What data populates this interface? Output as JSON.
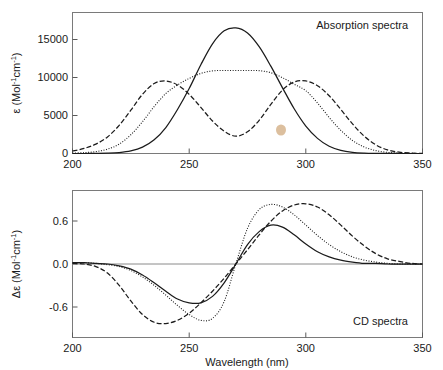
{
  "figure": {
    "width": 443,
    "height": 370,
    "background": "#ffffff",
    "line_color": "#1b1b1b"
  },
  "panels": {
    "top": {
      "annotation": "Absorption spectra",
      "ylabel_main": "ε (Mol",
      "ylabel_sup1": "-1",
      "ylabel_mid": "cm",
      "ylabel_sup2": "-1",
      "ylabel_end": ")",
      "ylabel_full": "ε (Mol⁻¹cm⁻¹)",
      "yticks": [
        "0",
        "5000",
        "10000",
        "15000"
      ],
      "xticks": [
        "200",
        "250",
        "300",
        "350"
      ]
    },
    "bottom": {
      "annotation": "CD spectra",
      "ylabel_full": "Δε (Mol⁻¹cm⁻¹)",
      "yticks": [
        "-0.6",
        "0.0",
        "0.6"
      ],
      "xticks": [
        "200",
        "250",
        "300",
        "350"
      ],
      "xlabel": "Wavelength (nm)"
    }
  },
  "chart_data": [
    {
      "type": "line",
      "id": "absorption-spectra",
      "title": "Absorption spectra",
      "xlabel": "Wavelength (nm)",
      "ylabel": "ε (Mol⁻¹cm⁻¹)",
      "xlim": [
        200,
        350
      ],
      "ylim": [
        0,
        18500
      ],
      "xticks": [
        200,
        250,
        300,
        350
      ],
      "yticks": [
        0,
        5000,
        10000,
        15000
      ],
      "grid": false,
      "legend": "none",
      "series": [
        {
          "name": "solid-monomer",
          "style": "solid",
          "color": "#1b1b1b",
          "description": "single gaussian band centred near 270 nm",
          "peaks": [
            {
              "x": 270,
              "y": 17400
            }
          ],
          "x": [
            200,
            205,
            210,
            215,
            220,
            225,
            230,
            235,
            240,
            245,
            250,
            255,
            260,
            265,
            270,
            275,
            280,
            285,
            290,
            295,
            300,
            305,
            310,
            315,
            320,
            325,
            330,
            335,
            340,
            345,
            350
          ],
          "y": [
            0,
            0,
            10,
            40,
            130,
            360,
            880,
            1900,
            3600,
            6100,
            9000,
            12300,
            15200,
            17000,
            17400,
            16700,
            14800,
            12100,
            9100,
            6200,
            3800,
            2100,
            1000,
            430,
            160,
            50,
            15,
            5,
            0,
            0,
            0
          ]
        },
        {
          "name": "dotted-intermediate",
          "style": "dotted",
          "color": "#1b1b1b",
          "description": "broad flat-topped band, plateau at ~11500 between 258 and 285 nm",
          "peaks": [
            {
              "x": 240,
              "y": 9000
            },
            {
              "x": 272,
              "y": 11500
            },
            {
              "x": 300,
              "y": 8700
            }
          ],
          "x": [
            200,
            205,
            210,
            215,
            220,
            225,
            230,
            235,
            240,
            245,
            250,
            255,
            260,
            265,
            270,
            275,
            280,
            285,
            290,
            295,
            300,
            305,
            310,
            315,
            320,
            325,
            330,
            335,
            340,
            345,
            350
          ],
          "y": [
            60,
            120,
            260,
            600,
            1300,
            2600,
            4400,
            6500,
            8300,
            9500,
            10400,
            11100,
            11450,
            11500,
            11500,
            11500,
            11480,
            11200,
            10500,
            9600,
            8700,
            7000,
            5000,
            3200,
            1800,
            900,
            400,
            160,
            60,
            20,
            0
          ]
        },
        {
          "name": "dashed-exciton-split",
          "style": "dashed",
          "color": "#1b1b1b",
          "description": "exciton-split double band with maxima near 240 and 300 nm and a trough near 270 nm",
          "peaks": [
            {
              "x": 240,
              "y": 10050
            },
            {
              "x": 300,
              "y": 10050
            }
          ],
          "troughs": [
            {
              "x": 270,
              "y": 2400
            }
          ],
          "x": [
            200,
            205,
            210,
            215,
            220,
            225,
            230,
            235,
            240,
            245,
            250,
            255,
            260,
            265,
            270,
            275,
            280,
            285,
            290,
            295,
            300,
            305,
            310,
            315,
            320,
            325,
            330,
            335,
            340,
            345,
            350
          ],
          "y": [
            350,
            700,
            1300,
            2300,
            3900,
            6000,
            8200,
            9700,
            10050,
            9500,
            8200,
            6400,
            4500,
            3100,
            2400,
            3000,
            4600,
            6800,
            8800,
            9900,
            10050,
            9400,
            8000,
            6100,
            4100,
            2400,
            1200,
            500,
            180,
            60,
            20
          ]
        }
      ]
    },
    {
      "type": "line",
      "id": "cd-spectra",
      "title": "CD spectra",
      "xlabel": "Wavelength (nm)",
      "ylabel": "Δε (Mol⁻¹cm⁻¹)",
      "xlim": [
        200,
        350
      ],
      "ylim": [
        -1.05,
        1.05
      ],
      "xticks": [
        200,
        250,
        300,
        350
      ],
      "yticks": [
        -0.6,
        0.0,
        0.6
      ],
      "grid": false,
      "zero_line": true,
      "legend": "none",
      "series": [
        {
          "name": "solid-cd",
          "style": "solid",
          "color": "#1b1b1b",
          "description": "bisignate couplet, negative trough -0.60 at 253 nm, positive peak +0.60 at 285 nm, crossover 270 nm",
          "crossover": 270,
          "trough": {
            "x": 253,
            "y": -0.6
          },
          "peak": {
            "x": 285,
            "y": 0.6
          },
          "x": [
            200,
            205,
            210,
            215,
            220,
            225,
            230,
            235,
            240,
            245,
            250,
            255,
            260,
            265,
            270,
            275,
            280,
            285,
            290,
            295,
            300,
            305,
            310,
            315,
            320,
            325,
            330,
            335,
            340,
            345,
            350
          ],
          "y": [
            0.02,
            0.02,
            0.01,
            0.0,
            -0.03,
            -0.08,
            -0.17,
            -0.29,
            -0.42,
            -0.54,
            -0.6,
            -0.6,
            -0.5,
            -0.29,
            0.0,
            0.3,
            0.5,
            0.6,
            0.57,
            0.45,
            0.31,
            0.19,
            0.11,
            0.06,
            0.03,
            0.01,
            0.01,
            0.0,
            0.0,
            0.0,
            0.0
          ]
        },
        {
          "name": "dotted-cd",
          "style": "dotted",
          "color": "#1b1b1b",
          "description": "larger couplet, trough -0.88 near 257 nm, peak +0.92 near 283 nm, crossover 270 nm",
          "crossover": 270,
          "trough": {
            "x": 257,
            "y": -0.88
          },
          "peak": {
            "x": 283,
            "y": 0.92
          },
          "x": [
            200,
            205,
            210,
            215,
            220,
            225,
            230,
            235,
            240,
            245,
            250,
            255,
            260,
            265,
            270,
            275,
            280,
            285,
            290,
            295,
            300,
            305,
            310,
            315,
            320,
            325,
            330,
            335,
            340,
            345,
            350
          ],
          "y": [
            0.02,
            0.02,
            0.01,
            -0.01,
            -0.04,
            -0.1,
            -0.2,
            -0.33,
            -0.48,
            -0.64,
            -0.78,
            -0.87,
            -0.84,
            -0.58,
            0.0,
            0.55,
            0.84,
            0.92,
            0.88,
            0.76,
            0.6,
            0.44,
            0.3,
            0.19,
            0.11,
            0.06,
            0.03,
            0.01,
            0.0,
            0.0,
            0.0
          ]
        },
        {
          "name": "dashed-cd",
          "style": "dashed",
          "color": "#1b1b1b",
          "description": "broad couplet, trough -0.92 near 240 nm, peak +0.93 near 300 nm, crossover 270 nm",
          "crossover": 270,
          "trough": {
            "x": 240,
            "y": -0.92
          },
          "peak": {
            "x": 300,
            "y": 0.93
          },
          "x": [
            200,
            205,
            210,
            215,
            220,
            225,
            230,
            235,
            240,
            245,
            250,
            255,
            260,
            265,
            270,
            275,
            280,
            285,
            290,
            295,
            300,
            305,
            310,
            315,
            320,
            325,
            330,
            335,
            340,
            345,
            350
          ],
          "y": [
            0.01,
            0.0,
            -0.04,
            -0.14,
            -0.33,
            -0.57,
            -0.78,
            -0.9,
            -0.92,
            -0.87,
            -0.76,
            -0.6,
            -0.42,
            -0.22,
            0.0,
            0.22,
            0.45,
            0.66,
            0.82,
            0.91,
            0.93,
            0.88,
            0.76,
            0.6,
            0.43,
            0.28,
            0.16,
            0.08,
            0.04,
            0.01,
            0.0
          ]
        }
      ]
    }
  ]
}
